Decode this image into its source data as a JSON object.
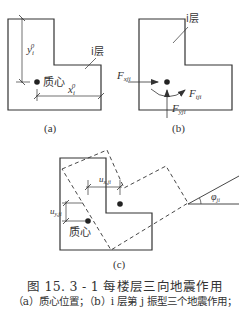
{
  "figure": {
    "number": "图 15. 3 - 1",
    "title": "每楼层三向地震作用",
    "caption_title": "图 15. 3 - 1    每楼层三向地震作用",
    "caption_sub": "（a）质心位置；（b）i 层第 j 振型三个地震作用；"
  },
  "panels": {
    "a": {
      "label": "(a)",
      "floor_label": "i层",
      "center_label": "质心",
      "dim_y": "y",
      "dim_y_sup": "0",
      "dim_y_sub": "i",
      "dim_x": "x",
      "dim_x_sup": "0",
      "dim_x_sub": "i"
    },
    "b": {
      "label": "(b)",
      "floor_label": "i层",
      "force_x": "F",
      "force_x_sub": "xji",
      "force_y": "F",
      "force_y_sub": "yji",
      "force_t": "F",
      "force_t_sub": "tji"
    },
    "c": {
      "label": "(c)",
      "center_label": "质心",
      "disp_x": "u",
      "disp_x_sub": "x,ji",
      "disp_y": "u",
      "disp_y_sub": "y,ji",
      "angle": "φ",
      "angle_sub": "ji"
    }
  },
  "colors": {
    "line": "#333333",
    "background": "#ffffff"
  }
}
